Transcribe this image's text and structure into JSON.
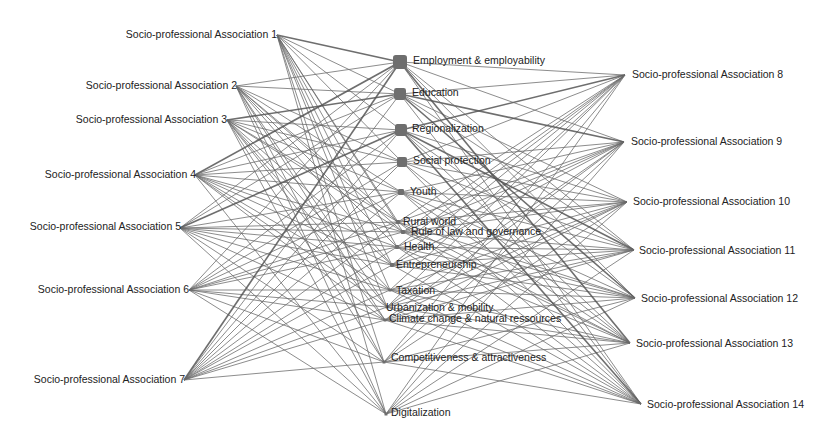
{
  "diagram": {
    "type": "bipartite-network",
    "left_nodes": [
      {
        "id": "spa1",
        "label": "Socio-professional Association 1",
        "x": 277,
        "y": 35
      },
      {
        "id": "spa2",
        "label": "Socio-professional Association 2",
        "x": 236,
        "y": 86
      },
      {
        "id": "spa3",
        "label": "Socio-professional Association 3",
        "x": 227,
        "y": 120
      },
      {
        "id": "spa4",
        "label": "Socio-professional Association 4",
        "x": 195,
        "y": 175
      },
      {
        "id": "spa5",
        "label": "Socio-professional Association 5",
        "x": 180,
        "y": 228
      },
      {
        "id": "spa6",
        "label": "Socio-professional Association 6",
        "x": 189,
        "y": 290
      },
      {
        "id": "spa7",
        "label": "Socio-professional Association 7",
        "x": 184,
        "y": 380
      }
    ],
    "topic_nodes": [
      {
        "id": "t1",
        "label": "Employment & employability",
        "x": 400,
        "y": 62,
        "size": 7
      },
      {
        "id": "t2",
        "label": "Education",
        "x": 400,
        "y": 94,
        "size": 6
      },
      {
        "id": "t3",
        "label": "Regionalization",
        "x": 401,
        "y": 130,
        "size": 6
      },
      {
        "id": "t4",
        "label": "Social protection",
        "x": 402,
        "y": 162,
        "size": 5
      },
      {
        "id": "t5",
        "label": "Youth",
        "x": 401,
        "y": 192,
        "size": 3
      },
      {
        "id": "t6",
        "label": "Rural world",
        "x": 398,
        "y": 222,
        "size": 2
      },
      {
        "id": "t7",
        "label": "Rule of law and governance",
        "x": 403,
        "y": 232,
        "size": 2
      },
      {
        "id": "t8",
        "label": "Health",
        "x": 397,
        "y": 247,
        "size": 2
      },
      {
        "id": "t9",
        "label": "Entrepreneurship",
        "x": 392,
        "y": 265,
        "size": 2
      },
      {
        "id": "t10",
        "label": "Taxation",
        "x": 390,
        "y": 290,
        "size": 1.5
      },
      {
        "id": "t11",
        "label": "Urbanization & mobility",
        "x": 387,
        "y": 307,
        "size": 1.5
      },
      {
        "id": "t12",
        "label": "Climate change & natural ressources",
        "x": 385,
        "y": 320,
        "size": 1.5
      },
      {
        "id": "t13",
        "label": "Competitiveness & attractiveness",
        "x": 384,
        "y": 362,
        "size": 1.5
      },
      {
        "id": "t14",
        "label": "Digitalization",
        "x": 386,
        "y": 414,
        "size": 1.5
      }
    ],
    "right_nodes": [
      {
        "id": "spa8",
        "label": "Socio-professional Association 8",
        "x": 625,
        "y": 75
      },
      {
        "id": "spa9",
        "label": "Socio-professional Association 9",
        "x": 624,
        "y": 142
      },
      {
        "id": "spa10",
        "label": "Socio-professional Association 10",
        "x": 627,
        "y": 202
      },
      {
        "id": "spa11",
        "label": "Socio-professional Association 11",
        "x": 634,
        "y": 250
      },
      {
        "id": "spa12",
        "label": "Socio-professional Association 12",
        "x": 635,
        "y": 298
      },
      {
        "id": "spa13",
        "label": "Socio-professional Association 13",
        "x": 630,
        "y": 343
      },
      {
        "id": "spa14",
        "label": "Socio-professional Association 14",
        "x": 641,
        "y": 404
      }
    ],
    "colors": {
      "edge": "#6a6a6a",
      "node": "#6e6e6e",
      "label": "#222222",
      "background": "#ffffff"
    }
  }
}
